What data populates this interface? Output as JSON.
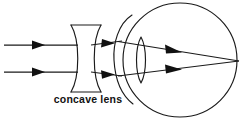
{
  "diagram": {
    "caption": "concave lens",
    "background_color": "#ffffff",
    "line_color": "#1a1a1a",
    "canvas": {
      "width": 245,
      "height": 122
    },
    "elements": {
      "incoming_rays": {
        "name": "parallel incident light rays",
        "count": 2,
        "orientation": "horizontal",
        "y_positions": [
          45,
          72
        ],
        "x_start": 4,
        "x_end": 72,
        "arrow_x": 40
      },
      "concave_lens": {
        "name": "biconcave diverging lens",
        "label": "concave lens",
        "top_y": 25,
        "bottom_y": 92,
        "left_x": 71,
        "right_x": 101,
        "waist_x_left": 81,
        "waist_x_right": 91,
        "center_y": 58
      },
      "diverged_rays": {
        "name": "rays diverging after concave lens",
        "arrow_x": 112,
        "y_at_lens": [
          45,
          72
        ],
        "y_at_cornea": [
          41,
          76
        ]
      },
      "eyeball": {
        "name": "eyeball outline",
        "center_x": 180,
        "center_y": 60,
        "radius": 57
      },
      "cornea": {
        "name": "cornea bulge arc",
        "top_point": [
          131,
          16
        ],
        "apex": [
          114,
          60
        ],
        "bottom_point": [
          131,
          103
        ]
      },
      "crystalline_lens": {
        "name": "biconvex crystalline lens",
        "center_x": 141,
        "top_y": 37,
        "bottom_y": 83,
        "half_width": 5
      },
      "focal_point": {
        "name": "retina focal convergence point",
        "x": 239,
        "y": 61
      },
      "internal_rays": {
        "name": "rays converging to retina",
        "arrow_x": 178
      }
    }
  }
}
